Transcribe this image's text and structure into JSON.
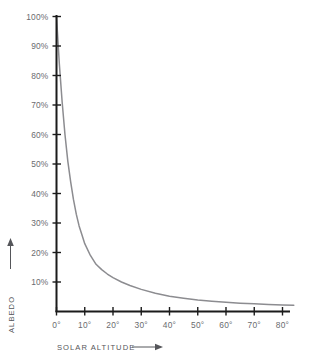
{
  "figure": {
    "caption_fragment": "",
    "background_color": "#ffffff",
    "curve_color": "#8c8c90",
    "axis_color": "#1b1b1b",
    "text_color": "#55565a"
  },
  "chart_data": {
    "type": "line",
    "title": "",
    "subtitle": "",
    "xlabel": "SOLAR ALTITUDE",
    "ylabel": "ALBEDO",
    "xlabel_arrow": "⟶",
    "ylabel_arrow": "↑",
    "grid": false,
    "legend": null,
    "legend_position": "none",
    "xlim": [
      0,
      80
    ],
    "ylim": [
      0,
      100
    ],
    "x_tick_labels": [
      "0°",
      "10°",
      "20°",
      "30°",
      "40°",
      "50°",
      "60°",
      "70°",
      "80°"
    ],
    "x_ticks": [
      0,
      10,
      20,
      30,
      40,
      50,
      60,
      70,
      80
    ],
    "y_tick_labels": [
      "10%",
      "20%",
      "30%",
      "40%",
      "50%",
      "60%",
      "70%",
      "80%",
      "90%",
      "100%"
    ],
    "y_ticks": [
      10,
      20,
      30,
      40,
      50,
      60,
      70,
      80,
      90,
      100
    ],
    "x_unit": "degrees",
    "y_unit": "percent",
    "series": [
      {
        "name": "Albedo vs solar altitude",
        "color": "#8c8c90",
        "x": [
          0,
          1,
          2,
          3,
          4,
          5,
          6,
          7,
          8,
          9,
          10,
          12,
          14,
          16,
          18,
          20,
          23,
          26,
          30,
          35,
          40,
          45,
          50,
          55,
          60,
          65,
          70,
          75,
          80,
          84
        ],
        "values": [
          100,
          84,
          71,
          60,
          51,
          44,
          38,
          33,
          29,
          26,
          23,
          19,
          16,
          14.2,
          12.7,
          11.5,
          10.0,
          8.8,
          7.5,
          6.2,
          5.2,
          4.5,
          3.9,
          3.5,
          3.1,
          2.8,
          2.6,
          2.4,
          2.2,
          2.1
        ]
      }
    ]
  }
}
